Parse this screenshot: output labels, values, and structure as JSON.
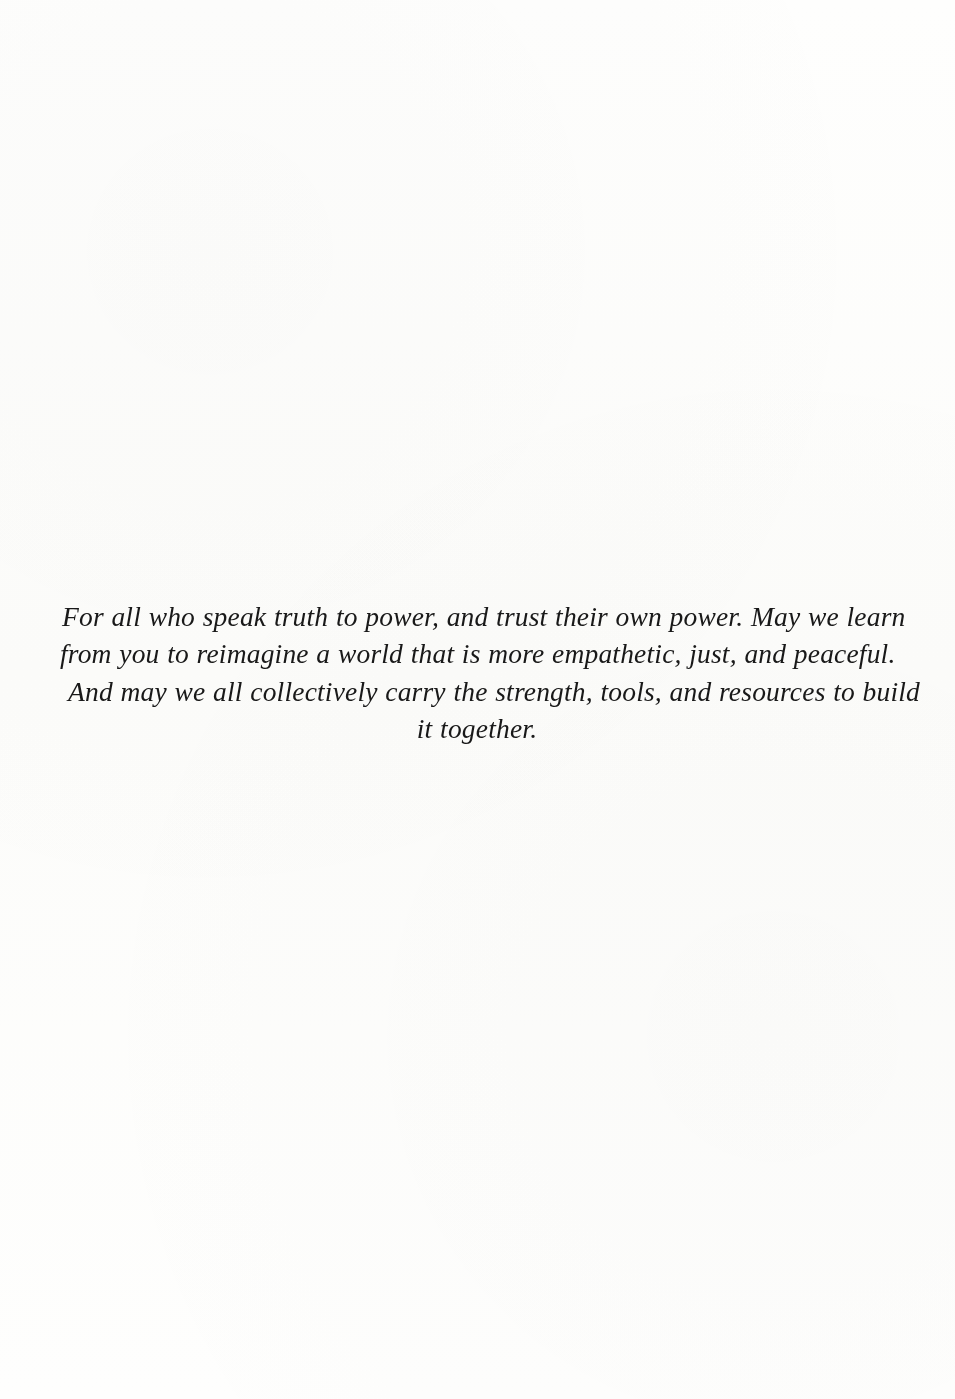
{
  "page": {
    "kind": "book-dedication-page",
    "background_color": "#fefefd",
    "ink_color": "#191919"
  },
  "dedication": {
    "full_text": "For all who speak truth to power, and trust their own power. May we learn from you to reimagine a world that is more empathetic, just, and peaceful. And may we all collectively carry the strength, tools, and resources to build it together.",
    "lines": [
      "For all who speak truth to power, and trust their own power. May we learn",
      "from you to reimagine a world that is more empathetic, just, and peaceful.",
      "And may we all collectively carry the strength, tools, and resources to build",
      "it together."
    ]
  }
}
